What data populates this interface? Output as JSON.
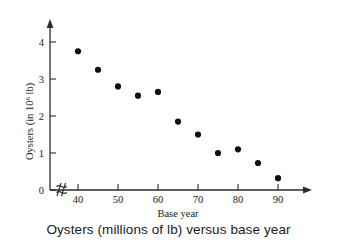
{
  "caption": "Oysters (millions of lb) versus base year",
  "chart_data": {
    "type": "scatter",
    "title": "",
    "xlabel": "Base year",
    "ylabel": "Oysters (in 10⁶ lb)",
    "ylabel_base": "Oysters (in 10",
    "ylabel_exponent": "6",
    "ylabel_tail": " lb)",
    "x": [
      40,
      45,
      50,
      55,
      60,
      65,
      70,
      75,
      80,
      85,
      90
    ],
    "values": [
      3.75,
      3.25,
      2.8,
      2.55,
      2.65,
      1.85,
      1.5,
      1.0,
      1.1,
      0.73,
      0.32
    ],
    "xlim": [
      36,
      96
    ],
    "ylim": [
      0,
      4.55
    ],
    "xticks": [
      40,
      50,
      60,
      70,
      80,
      90
    ],
    "xtick_labels": [
      "40",
      "50",
      "60",
      "70",
      "80",
      "90"
    ],
    "yticks": [
      0,
      1,
      2,
      3,
      4
    ],
    "ytick_labels": [
      "0",
      "1",
      "2",
      "3",
      "4"
    ],
    "grid": false,
    "legend": false,
    "axis_break_x": true,
    "marker_color": "#111111",
    "axis_color": "#2b2b2b"
  }
}
